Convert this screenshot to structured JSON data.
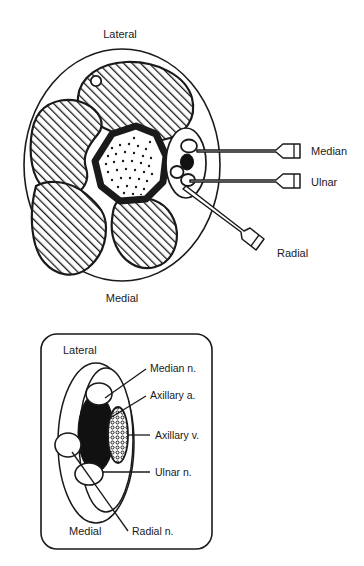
{
  "figure": {
    "panels": [
      {
        "id": "upper-panel",
        "name": "arm-cross-section",
        "orientation_labels": {
          "top": "Lateral",
          "bottom": "Medial"
        },
        "anatomy": [
          {
            "name": "arm-outline",
            "kind": "outline"
          },
          {
            "name": "muscle-compartment-superior",
            "kind": "hatched-muscle"
          },
          {
            "name": "muscle-compartment-lateral",
            "kind": "hatched-muscle"
          },
          {
            "name": "muscle-compartment-inferior",
            "kind": "hatched-muscle"
          },
          {
            "name": "muscle-compartment-posterior",
            "kind": "hatched-muscle"
          },
          {
            "name": "humerus-bone",
            "kind": "bone-cortex-with-stippled-marrow"
          },
          {
            "name": "cephalic-vein",
            "kind": "small-open-vessel"
          },
          {
            "name": "neurovascular-sheath",
            "kind": "sheath-ellipse"
          },
          {
            "name": "axillary-artery",
            "kind": "filled-artery"
          },
          {
            "name": "median-nerve-circle",
            "kind": "open-nerve"
          },
          {
            "name": "ulnar-nerve-circle",
            "kind": "open-nerve"
          },
          {
            "name": "radial-nerve-circle",
            "kind": "open-nerve"
          }
        ],
        "needles": [
          {
            "label": "Median",
            "name": "needle-median"
          },
          {
            "label": "Ulnar",
            "name": "needle-ulnar"
          },
          {
            "label": "Radial",
            "name": "needle-radial"
          }
        ]
      },
      {
        "id": "lower-panel",
        "name": "neurovascular-bundle-detail",
        "orientation_labels": {
          "top": "Lateral",
          "bottom": "Medial"
        },
        "labels": [
          {
            "text": "Median n.",
            "name": "label-median-nerve"
          },
          {
            "text": "Axillary a.",
            "name": "label-axillary-artery"
          },
          {
            "text": "Axillary v.",
            "name": "label-axillary-vein"
          },
          {
            "text": "Ulnar n.",
            "name": "label-ulnar-nerve"
          },
          {
            "text": "Radial n.",
            "name": "label-radial-nerve"
          }
        ],
        "anatomy": [
          {
            "name": "sheath-outline-ellipse",
            "kind": "outline"
          },
          {
            "name": "inner-ellipse",
            "kind": "outline"
          },
          {
            "name": "axillary-artery-filled",
            "kind": "filled-artery"
          },
          {
            "name": "axillary-vein-stippled",
            "kind": "stippled-vein"
          },
          {
            "name": "median-nerve-circle",
            "kind": "open-nerve"
          },
          {
            "name": "radial-nerve-circle",
            "kind": "open-nerve"
          },
          {
            "name": "ulnar-nerve-circle",
            "kind": "open-nerve"
          }
        ]
      }
    ]
  },
  "colors": {
    "ink": "#1a1a1a",
    "paper": "#ffffff",
    "artery_fill": "#111111",
    "hatch": "#1a1a1a"
  }
}
